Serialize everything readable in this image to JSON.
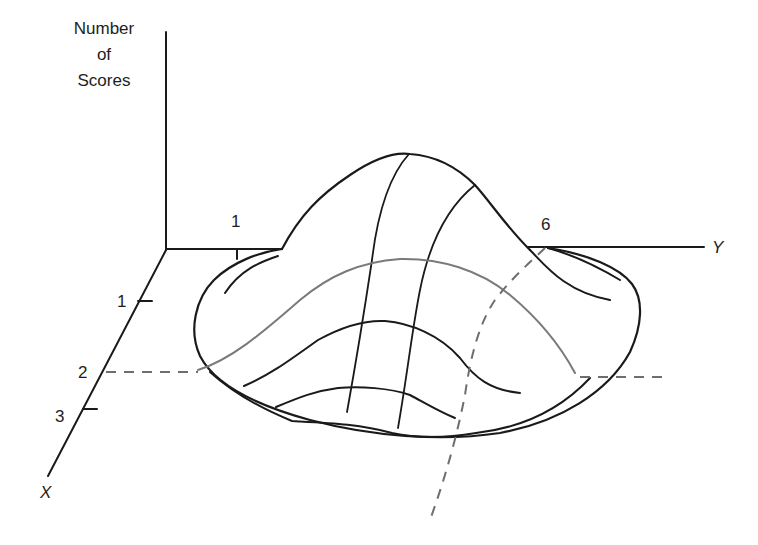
{
  "figure": {
    "type": "3d-bivariate-frequency-surface",
    "axis_labels": {
      "vertical": [
        "Number",
        "of",
        "Scores"
      ],
      "y_axis": "Y",
      "x_axis": "X"
    },
    "y_axis_ticks": [
      "1",
      "6"
    ],
    "x_axis_ticks": [
      "1",
      "2",
      "3"
    ],
    "colors": {
      "ink": "#1a1a1a",
      "highlight_contour": "#7a7a7a",
      "dashed_guides": "#6e6e6e",
      "background": "#ffffff"
    },
    "annotations": {
      "dashed_guide_x": "X = 2 (horizontal dashed slice through surface)",
      "dashed_guide_y": "Y = 6 (curved dashed slice through surface)"
    }
  }
}
